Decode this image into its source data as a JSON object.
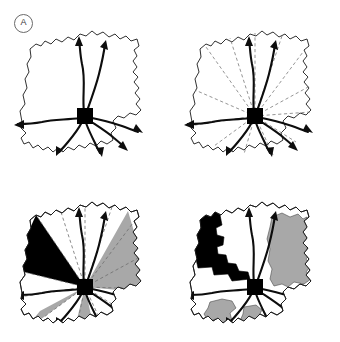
{
  "figure": {
    "background_color": "#ffffff",
    "panel_columns": 2,
    "panel_rows": 2,
    "outline_color": "#1a1a1a",
    "fill_white": "#ffffff",
    "fill_black": "#000000",
    "fill_gray": "#a8a8a8",
    "dashed_line_color": "#7a7a7a",
    "hub_color": "#000000"
  },
  "panels": [
    {
      "id": "A",
      "label": "A",
      "position": "top-left",
      "description": "Region outline with central hub node and eight radiating directed flow arrows",
      "has_outline": true,
      "has_hub": true,
      "has_arrows": true,
      "arrow_count": 8,
      "has_dashed_sectors": false,
      "shaded_sector_count": 0,
      "shaded_subregion_count": 0
    },
    {
      "id": "B",
      "label": "B",
      "position": "top-right",
      "description": "Same outline and flow arrows overlaid with twelve dashed radial sector boundaries from the hub",
      "has_outline": true,
      "has_hub": true,
      "has_arrows": true,
      "arrow_count": 8,
      "has_dashed_sectors": true,
      "dashed_sector_count": 12,
      "shaded_sector_count": 0,
      "shaded_subregion_count": 0
    },
    {
      "id": "C",
      "label": "C",
      "position": "bottom-left",
      "description": "Radial sectors classified by shading: one black sector to the northwest, one large gray sector to the east, one gray sector to the southwest and one gray sector to the south",
      "has_outline": true,
      "has_hub": true,
      "has_arrows": true,
      "arrow_count": 8,
      "has_dashed_sectors": true,
      "dashed_sector_count": 12,
      "shaded_sector_count": 4,
      "black_sector_count": 1,
      "gray_sector_count": 3,
      "shaded_subregion_count": 0
    },
    {
      "id": "D",
      "label": "D",
      "position": "bottom-right",
      "description": "Administrative sub-regions classified by shading: black cluster in the northwest, gray cluster in the east, two small gray units in the south",
      "has_outline": true,
      "has_hub": true,
      "has_arrows": true,
      "arrow_count": 8,
      "has_dashed_sectors": false,
      "shaded_sector_count": 0,
      "shaded_subregion_count": 4,
      "black_subregion_count": 1,
      "gray_subregion_count": 3
    }
  ]
}
